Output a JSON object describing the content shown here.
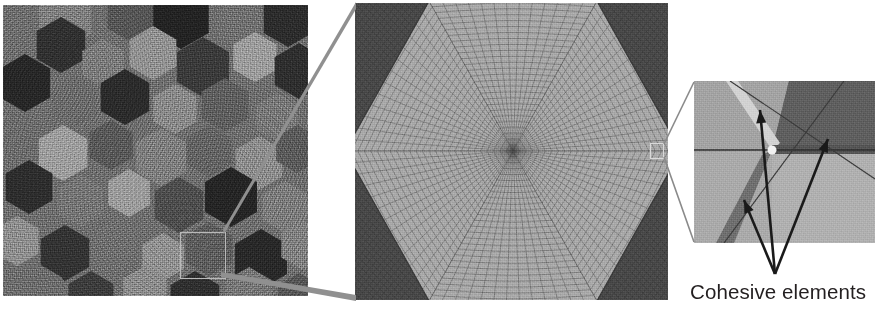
{
  "figure": {
    "type": "multiscale-microstructure-schematic",
    "panel_count": 3,
    "caption": "Cohesive elements"
  },
  "panels": {
    "microstructure": {
      "name": "polycrystalline-microstructure",
      "x": 3,
      "y": 5,
      "width": 305,
      "height": 291,
      "description": "Grainy SEM-like polycrystal with hexagonal grains of varying gray level",
      "background_gray": "#6d6d6d",
      "selection_box": {
        "x": 177,
        "y": 227,
        "width": 46,
        "height": 47,
        "stroke": "#b9b9b9"
      },
      "grain_grays": [
        "#2a2a2a",
        "#353535",
        "#434343",
        "#565656",
        "#656565",
        "#767676",
        "#868686",
        "#969696",
        "#a6a6a6"
      ],
      "grains": [
        {
          "cx": 62,
          "cy": 14,
          "r": 30,
          "fill": "#7e7e7e"
        },
        {
          "cx": 128,
          "cy": 10,
          "r": 27,
          "fill": "#555555"
        },
        {
          "cx": 178,
          "cy": 12,
          "r": 32,
          "fill": "#232323"
        },
        {
          "cx": 238,
          "cy": 18,
          "r": 26,
          "fill": "#6f6f6f"
        },
        {
          "cx": 285,
          "cy": 14,
          "r": 28,
          "fill": "#2c2c2c"
        },
        {
          "cx": 58,
          "cy": 40,
          "r": 28,
          "fill": "#303030"
        },
        {
          "cx": 100,
          "cy": 58,
          "r": 24,
          "fill": "#7a7a7a"
        },
        {
          "cx": 150,
          "cy": 48,
          "r": 27,
          "fill": "#909090"
        },
        {
          "cx": 200,
          "cy": 62,
          "r": 30,
          "fill": "#3a3a3a"
        },
        {
          "cx": 252,
          "cy": 52,
          "r": 25,
          "fill": "#9b9b9b"
        },
        {
          "cx": 296,
          "cy": 66,
          "r": 28,
          "fill": "#2e2e2e"
        },
        {
          "cx": 22,
          "cy": 78,
          "r": 29,
          "fill": "#272727"
        },
        {
          "cx": 72,
          "cy": 96,
          "r": 26,
          "fill": "#6a6a6a"
        },
        {
          "cx": 122,
          "cy": 92,
          "r": 28,
          "fill": "#2b2b2b"
        },
        {
          "cx": 172,
          "cy": 104,
          "r": 25,
          "fill": "#888888"
        },
        {
          "cx": 222,
          "cy": 100,
          "r": 27,
          "fill": "#5e5e5e"
        },
        {
          "cx": 274,
          "cy": 112,
          "r": 24,
          "fill": "#777777"
        },
        {
          "cx": 16,
          "cy": 132,
          "r": 26,
          "fill": "#6b6b6b"
        },
        {
          "cx": 60,
          "cy": 148,
          "r": 28,
          "fill": "#9c9c9c"
        },
        {
          "cx": 108,
          "cy": 140,
          "r": 25,
          "fill": "#585858"
        },
        {
          "cx": 158,
          "cy": 152,
          "r": 29,
          "fill": "#7d7d7d"
        },
        {
          "cx": 206,
          "cy": 146,
          "r": 26,
          "fill": "#636363"
        },
        {
          "cx": 256,
          "cy": 158,
          "r": 27,
          "fill": "#8b8b8b"
        },
        {
          "cx": 294,
          "cy": 144,
          "r": 24,
          "fill": "#5a5a5a"
        },
        {
          "cx": 26,
          "cy": 182,
          "r": 27,
          "fill": "#2d2d2d"
        },
        {
          "cx": 78,
          "cy": 196,
          "r": 26,
          "fill": "#747474"
        },
        {
          "cx": 126,
          "cy": 188,
          "r": 24,
          "fill": "#9a9a9a"
        },
        {
          "cx": 176,
          "cy": 200,
          "r": 28,
          "fill": "#4d4d4d"
        },
        {
          "cx": 228,
          "cy": 192,
          "r": 30,
          "fill": "#252525"
        },
        {
          "cx": 282,
          "cy": 202,
          "r": 26,
          "fill": "#7b7b7b"
        },
        {
          "cx": 14,
          "cy": 236,
          "r": 25,
          "fill": "#8d8d8d"
        },
        {
          "cx": 62,
          "cy": 248,
          "r": 28,
          "fill": "#333333"
        },
        {
          "cx": 112,
          "cy": 240,
          "r": 26,
          "fill": "#6e6e6e"
        },
        {
          "cx": 160,
          "cy": 252,
          "r": 24,
          "fill": "#8f8f8f"
        },
        {
          "cx": 206,
          "cy": 244,
          "r": 27,
          "fill": "#5c5c5c"
        },
        {
          "cx": 258,
          "cy": 254,
          "r": 30,
          "fill": "#282828"
        },
        {
          "cx": 300,
          "cy": 240,
          "r": 25,
          "fill": "#7f7f7f"
        },
        {
          "cx": 36,
          "cy": 286,
          "r": 27,
          "fill": "#6c6c6c"
        },
        {
          "cx": 88,
          "cy": 292,
          "r": 26,
          "fill": "#3c3c3c"
        },
        {
          "cx": 142,
          "cy": 286,
          "r": 25,
          "fill": "#8a8a8a"
        },
        {
          "cx": 192,
          "cy": 294,
          "r": 28,
          "fill": "#2f2f2f"
        },
        {
          "cx": 246,
          "cy": 288,
          "r": 26,
          "fill": "#767676"
        },
        {
          "cx": 296,
          "cy": 292,
          "r": 24,
          "fill": "#555555"
        }
      ]
    },
    "mesh": {
      "name": "meshed-hexagonal-grain",
      "x": 355,
      "y": 3,
      "width": 313,
      "height": 297,
      "description": "Finite element quadrilateral mesh of a central hexagonal grain surrounded by darker neighbouring grains",
      "background_gray": "#8f8f8f",
      "center_grain_fill": "#a9a9a9",
      "neighbor_grain_fill": "#4a4a4a",
      "mesh_line_color": "#4b4b4b",
      "hexagon": {
        "cx": 158,
        "cy": 148,
        "rx": 168,
        "ry": 150
      },
      "marker_box": {
        "x": 295,
        "y": 140,
        "width": 14,
        "height": 16,
        "stroke": "#d9d9d9"
      }
    },
    "junction": {
      "name": "triple-junction-detail",
      "x": 694,
      "y": 81,
      "width": 181,
      "height": 162,
      "description": "Close-up of a grain triple junction with cohesive interface layers between three grains",
      "grain_fills": [
        "#a3a3a3",
        "#606060",
        "#b0b0b0"
      ],
      "cohesive_band_light": "#d2d2d2",
      "cohesive_band_dark": "#525252",
      "junction_point": {
        "x": 78,
        "y": 69
      }
    }
  },
  "annotations": {
    "arrows": {
      "name": "cohesive-element-arrows",
      "count": 3,
      "converge_point": {
        "x": 775,
        "y": 274
      },
      "tips": [
        {
          "x": 760,
          "y": 110
        },
        {
          "x": 744,
          "y": 200
        },
        {
          "x": 828,
          "y": 139
        }
      ],
      "color": "#1a1a1a"
    },
    "connectors": {
      "name": "zoom-connector-lines",
      "color": "#909090",
      "from_box": {
        "x": 177,
        "y": 227,
        "width": 46,
        "height": 47
      },
      "to_panel": "mesh",
      "lines": [
        {
          "x1": 223,
          "y1": 231,
          "x2": 356,
          "y2": 4
        },
        {
          "x1": 221,
          "y1": 276,
          "x2": 356,
          "y2": 299
        }
      ]
    },
    "junction_connectors": {
      "name": "junction-zoom-connector-lines",
      "color": "#8a8a8a",
      "lines": [
        {
          "x1": 664,
          "y1": 143,
          "x2": 694,
          "y2": 82
        },
        {
          "x1": 664,
          "y1": 158,
          "x2": 694,
          "y2": 242
        }
      ]
    }
  },
  "caption": {
    "name": "cohesive-elements-label",
    "text": "Cohesive elements",
    "x": 690,
    "y": 281,
    "font_size_px": 20.5,
    "color": "#231f20"
  }
}
